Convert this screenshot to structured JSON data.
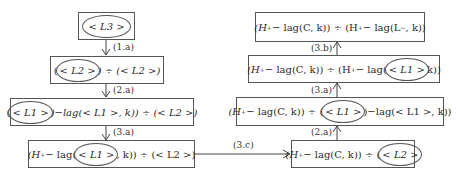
{
  "left_chain": {
    "box1": {
      "pre": "",
      "circled": "< L3 >",
      "post": ""
    },
    "box2": {
      "pre": "(",
      "circled": "< L2 >",
      "post": ") ÷ (< L2 >)"
    },
    "box3": {
      "pre": "(",
      "circled": "< L1 >",
      "post": ")−lag(< L1 >, k)) ÷ (< L2 >)"
    },
    "box4": {
      "pre": "(H",
      "sup": "+",
      "mid": " − lag(",
      "circled": "< L1 >",
      "post": ", k)) ÷ (< L2 >)"
    }
  },
  "right_chain": {
    "box1": {
      "text_a": "(H",
      "sup1": "+",
      "text_b": " − lag(C, k)) ÷ (H",
      "sup2": "+",
      "text_c": " − lag(L",
      "sup3": "−",
      "text_d": ", k))"
    },
    "box2": {
      "text_a": "(H",
      "sup1": "+",
      "text_b": " − lag(C, k)) ÷ (H",
      "sup2": "+",
      "text_c": " − lag(",
      "circled": "< L1 >",
      "post": "k))"
    },
    "box3": {
      "text_a": "(H",
      "sup1": "+",
      "text_b": " − lag(C, k)) ÷ (",
      "circled": "< L1 >",
      "post": ")−lag(< L1 >, k))"
    },
    "box4": {
      "text_a": "(H",
      "sup1": "+",
      "text_b": " − lag(C, k)) ÷ (",
      "circled": "< L2 >",
      "post": ""
    }
  },
  "edges": {
    "left_1": "(1.a)",
    "left_2": "(2.a)",
    "left_3": "(3.a)",
    "cross": "(3.c)",
    "right_1": "(2.a)",
    "right_2": "(3.a)",
    "right_3": "(3.b)"
  }
}
